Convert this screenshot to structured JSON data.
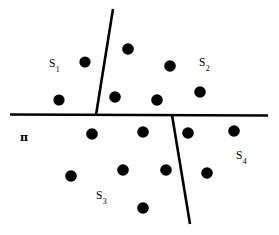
{
  "figure": {
    "type": "diagram",
    "width": 279,
    "height": 235,
    "background_color": "#ffffff",
    "ink_color": "#000000",
    "plane_label": {
      "text": "π",
      "name": "pi",
      "x": 20,
      "y": 132
    },
    "region_labels": [
      {
        "id": "S1",
        "base": "S",
        "subscript": "1",
        "x": 49,
        "y": 58
      },
      {
        "id": "S2",
        "base": "S",
        "subscript": "2",
        "x": 199,
        "y": 57
      },
      {
        "id": "S3",
        "base": "S",
        "subscript": "3",
        "x": 96,
        "y": 190
      },
      {
        "id": "S4",
        "base": "S",
        "subscript": "4",
        "x": 236,
        "y": 150
      }
    ],
    "lines": [
      {
        "name": "horizontal-divider",
        "x1": 10,
        "y1": 114.5,
        "x2": 268,
        "y2": 115.5,
        "width": 2.6
      },
      {
        "name": "upper-slanted-divider",
        "x1": 113,
        "y1": 9,
        "x2": 96,
        "y2": 115,
        "width": 2.6
      },
      {
        "name": "lower-slanted-divider",
        "x1": 172,
        "y1": 115,
        "x2": 190,
        "y2": 224,
        "width": 2.6
      }
    ],
    "points": [
      {
        "x": 85,
        "y": 62,
        "r": 5.6,
        "region": "S1"
      },
      {
        "x": 59,
        "y": 100,
        "r": 5.6,
        "region": "S1"
      },
      {
        "x": 128,
        "y": 49,
        "r": 5.8,
        "region": "S2"
      },
      {
        "x": 170,
        "y": 66,
        "r": 5.8,
        "region": "S2"
      },
      {
        "x": 115,
        "y": 97,
        "r": 5.8,
        "region": "S2"
      },
      {
        "x": 157,
        "y": 100,
        "r": 5.8,
        "region": "S2"
      },
      {
        "x": 200,
        "y": 92,
        "r": 5.8,
        "region": "S2"
      },
      {
        "x": 92,
        "y": 134,
        "r": 5.8,
        "region": "S3"
      },
      {
        "x": 143,
        "y": 132,
        "r": 5.8,
        "region": "S3"
      },
      {
        "x": 71,
        "y": 176,
        "r": 5.8,
        "region": "S3"
      },
      {
        "x": 123,
        "y": 170,
        "r": 5.8,
        "region": "S3"
      },
      {
        "x": 166,
        "y": 170,
        "r": 5.8,
        "region": "S3"
      },
      {
        "x": 143,
        "y": 208,
        "r": 5.8,
        "region": "S3"
      },
      {
        "x": 188,
        "y": 133,
        "r": 5.8,
        "region": "S4"
      },
      {
        "x": 234,
        "y": 131,
        "r": 5.8,
        "region": "S4"
      },
      {
        "x": 207,
        "y": 173,
        "r": 5.8,
        "region": "S4"
      }
    ]
  }
}
